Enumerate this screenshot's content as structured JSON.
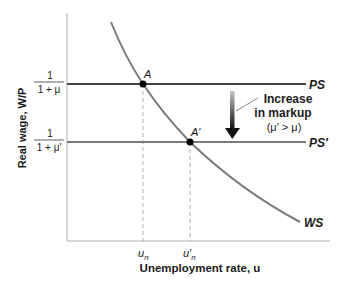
{
  "diagram": {
    "type": "economics-labor-market",
    "y_axis_label": "Real wage, W/P",
    "x_axis_label": "Unemployment rate, u",
    "y_ticks": [
      {
        "numerator": "1",
        "denominator": "1 + μ"
      },
      {
        "numerator": "1",
        "denominator": "1 + μ′"
      }
    ],
    "x_ticks": [
      {
        "label": "u",
        "sub": "n"
      },
      {
        "label": "u′",
        "sub": "n"
      }
    ],
    "curves": {
      "ps": {
        "label": "PS",
        "color": "#444444"
      },
      "ps_prime": {
        "label": "PS′",
        "color": "#7a7a7a"
      },
      "ws": {
        "label": "WS",
        "color": "#7a7a7a"
      }
    },
    "points": {
      "a": {
        "label": "A"
      },
      "a_prime": {
        "label": "A′"
      }
    },
    "annotation": {
      "line1": "Increase",
      "line2": "in markup",
      "line3": "(μ′ > μ)"
    },
    "colors": {
      "axis": "#b0b0b0",
      "dashed": "#9a9a9a",
      "arrow_top": "#bdbdbd",
      "arrow_bottom": "#111111",
      "text": "#1a1a1a"
    }
  }
}
